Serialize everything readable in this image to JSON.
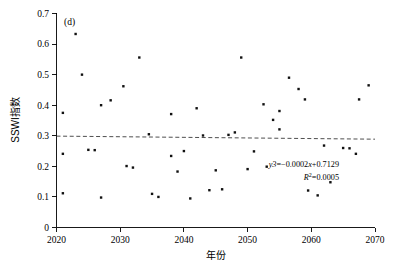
{
  "panel": {
    "label": "(d)"
  },
  "axes": {
    "x_title": "年份",
    "y_title": "SSWI指数",
    "x_ticks": [
      "2020",
      "2030",
      "2040",
      "2050",
      "2060",
      "2070"
    ],
    "y_ticks": [
      "0",
      "0.1",
      "0.2",
      "0.3",
      "0.4",
      "0.5",
      "0.6",
      "0.7"
    ]
  },
  "annotations": {
    "equation": "y3=−0.0002x+0.7129",
    "equation_prefix": "y3",
    "equation_body": "=−0.0002",
    "equation_var": "x",
    "equation_suffix": "+0.7129",
    "r_squared_symbol": "R",
    "r_squared_sup": "2",
    "r_squared_value": "=0.0005"
  },
  "colors": {
    "point": "#111111",
    "trend": "#3a3a3a",
    "axis": "#000000",
    "background": "#ffffff"
  },
  "chart_data": {
    "type": "scatter",
    "title": "(d)",
    "xlabel": "年份",
    "ylabel": "SSWI指数",
    "xlim": [
      2020,
      2070
    ],
    "ylim": [
      0,
      0.7
    ],
    "xticks": [
      2020,
      2030,
      2040,
      2050,
      2060,
      2070
    ],
    "yticks": [
      0,
      0.1,
      0.2,
      0.3,
      0.4,
      0.5,
      0.6,
      0.7
    ],
    "grid": false,
    "legend": null,
    "series": [
      {
        "name": "SSWI指数",
        "marker": "square",
        "points": [
          [
            2021,
            0.375
          ],
          [
            2021,
            0.112
          ],
          [
            2021,
            0.241
          ],
          [
            2023,
            0.633
          ],
          [
            2024,
            0.5
          ],
          [
            2025,
            0.254
          ],
          [
            2026,
            0.253
          ],
          [
            2027,
            0.4
          ],
          [
            2027,
            0.098
          ],
          [
            2028.5,
            0.416
          ],
          [
            2030.5,
            0.462
          ],
          [
            2031,
            0.201
          ],
          [
            2032,
            0.196
          ],
          [
            2033,
            0.556
          ],
          [
            2034.5,
            0.305
          ],
          [
            2035,
            0.11
          ],
          [
            2036,
            0.1
          ],
          [
            2038,
            0.371
          ],
          [
            2038,
            0.234
          ],
          [
            2039,
            0.183
          ],
          [
            2040,
            0.25
          ],
          [
            2041,
            0.095
          ],
          [
            2042,
            0.39
          ],
          [
            2043,
            0.301
          ],
          [
            2044,
            0.122
          ],
          [
            2045,
            0.187
          ],
          [
            2046,
            0.125
          ],
          [
            2047,
            0.303
          ],
          [
            2048,
            0.311
          ],
          [
            2049,
            0.556
          ],
          [
            2050,
            0.191
          ],
          [
            2051,
            0.249
          ],
          [
            2052.5,
            0.403
          ],
          [
            2053,
            0.199
          ],
          [
            2054,
            0.352
          ],
          [
            2055,
            0.321
          ],
          [
            2055,
            0.381
          ],
          [
            2056.5,
            0.49
          ],
          [
            2058,
            0.453
          ],
          [
            2059,
            0.419
          ],
          [
            2059.5,
            0.121
          ],
          [
            2061,
            0.105
          ],
          [
            2062,
            0.268
          ],
          [
            2063,
            0.148
          ],
          [
            2065,
            0.26
          ],
          [
            2066,
            0.259
          ],
          [
            2067,
            0.241
          ],
          [
            2067.5,
            0.419
          ],
          [
            2069,
            0.465
          ]
        ]
      }
    ],
    "trend": {
      "type": "linear",
      "equation": "y3=−0.0002x+0.7129",
      "slope": -0.0002,
      "intercept": 0.7129,
      "r_squared": 0.0005,
      "style": "dashed",
      "y_at_xmin": 0.2989,
      "y_at_xmax": 0.2889
    }
  }
}
